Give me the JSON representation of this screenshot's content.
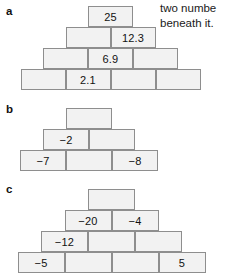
{
  "intro": {
    "line1": "two numbe",
    "line2": "beneath it."
  },
  "sections": [
    {
      "label": "a",
      "rows": [
        {
          "cells": [
            {
              "value": "25"
            }
          ]
        },
        {
          "cells": [
            {
              "value": ""
            },
            {
              "value": "12.3"
            }
          ]
        },
        {
          "cells": [
            {
              "value": ""
            },
            {
              "value": "6.9"
            },
            {
              "value": ""
            }
          ]
        },
        {
          "cells": [
            {
              "value": ""
            },
            {
              "value": "2.1"
            },
            {
              "value": ""
            },
            {
              "value": ""
            }
          ]
        }
      ]
    },
    {
      "label": "b",
      "rows": [
        {
          "cells": [
            {
              "value": ""
            }
          ]
        },
        {
          "cells": [
            {
              "value": "−2"
            },
            {
              "value": ""
            }
          ]
        },
        {
          "cells": [
            {
              "value": "−7"
            },
            {
              "value": ""
            },
            {
              "value": "−8"
            }
          ]
        }
      ]
    },
    {
      "label": "c",
      "rows": [
        {
          "cells": [
            {
              "value": ""
            }
          ]
        },
        {
          "cells": [
            {
              "value": "−20"
            },
            {
              "value": "−4"
            }
          ]
        },
        {
          "cells": [
            {
              "value": "−12"
            },
            {
              "value": ""
            },
            {
              "value": ""
            }
          ]
        },
        {
          "cells": [
            {
              "value": "−5"
            },
            {
              "value": ""
            },
            {
              "value": ""
            },
            {
              "value": "5"
            }
          ]
        }
      ]
    }
  ],
  "geometry": {
    "brick_w": 68,
    "brick_h": 21,
    "sections": [
      {
        "label_x": 6,
        "label_y": 6,
        "cx": 110.5,
        "top": 6,
        "rows": 4,
        "brick_w": 45,
        "brick_h": 21
      },
      {
        "label_x": 6,
        "label_y": 104,
        "cx": 89,
        "top": 108,
        "rows": 3,
        "brick_w": 46,
        "brick_h": 21
      },
      {
        "label_x": 6,
        "label_y": 184,
        "cx": 111.5,
        "top": 189,
        "rows": 4,
        "brick_w": 47,
        "brick_h": 21
      }
    ]
  },
  "colors": {
    "brick_fill": "#f2f2f2",
    "brick_stroke": "#8e8e8e",
    "text": "#111111",
    "page_bg": "#ffffff"
  }
}
